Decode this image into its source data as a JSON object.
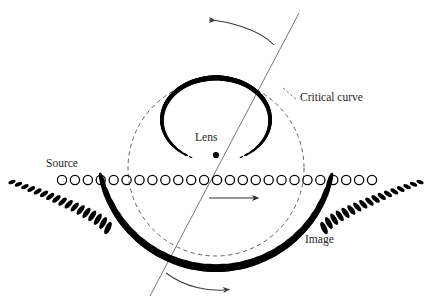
{
  "figure": {
    "background_color": "#ffffff",
    "ink_color": "#000000",
    "label_color": "#231f20",
    "dash_color": "#555555",
    "line_color": "#6b6b6b"
  },
  "labels": {
    "source": "Source",
    "lens": "Lens",
    "critical_curve": "Critical curve",
    "image": "Image"
  },
  "label_positions": {
    "source": {
      "x": 46,
      "y": 167
    },
    "lens": {
      "x": 195,
      "y": 141
    },
    "critical_curve": {
      "x": 300,
      "y": 101
    },
    "image": {
      "x": 305,
      "y": 243
    }
  },
  "chart_data": {
    "type": "scatter",
    "xlabel": "",
    "ylabel": "",
    "xlim": [
      0,
      436
    ],
    "ylim": [
      0,
      305
    ],
    "grid": false,
    "legend": "none",
    "annotations": [
      "Source",
      "Lens",
      "Critical curve",
      "Image"
    ],
    "series": [
      {
        "name": "Source track (open circles)",
        "marker": "open-circle",
        "count": 25,
        "y": 180,
        "x_start": 62,
        "x_end": 372,
        "radius": 4.6
      },
      {
        "name": "Critical curve (dashed circle)",
        "marker": "dashed-circle",
        "center": {
          "x": 216,
          "y": 168
        },
        "radius": 88
      },
      {
        "name": "Lens centre",
        "marker": "filled-dot",
        "x": 216,
        "y": 155,
        "radius": 3.1
      },
      {
        "name": "Diagonal line",
        "marker": "line",
        "x1": 150,
        "y1": 296,
        "x2": 299,
        "y2": 13
      }
    ],
    "images_upper_ring": {
      "description": "Inner ring of elongated image ellipses above the source line, inside the critical curve",
      "center": {
        "x": 216,
        "y": 118
      },
      "count": 38
    },
    "images_lower_arc": {
      "description": "Outer sweeping arc of elongated image ellipses below the source line, extending into long tails",
      "count": 44
    }
  },
  "arrows": [
    {
      "name": "top-rotation-arrow",
      "direction": "left",
      "style": "curved"
    },
    {
      "name": "middle-motion-arrow",
      "direction": "right",
      "style": "straight"
    },
    {
      "name": "bottom-rotation-arrow",
      "direction": "right",
      "style": "curved"
    }
  ]
}
